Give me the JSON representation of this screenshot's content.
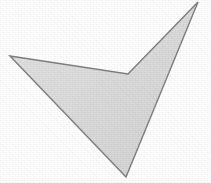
{
  "canvas": {
    "width": 211,
    "height": 183,
    "background_color": "#ffffff",
    "alt_text": "Scanned grayscale arrowhead / checkmark polygon"
  },
  "shape": {
    "name": "arrowhead-checkmark-polygon",
    "type": "polygon",
    "fill_color": "#dcdcdc",
    "stroke_color": "#7f7f7f",
    "stroke_width": 1.4,
    "texture": "scanned-paper-noise",
    "points_attr": "10,56 128,74 198,2 126,177",
    "vertices": [
      {
        "label": "left-tip",
        "x": 10,
        "y": 56
      },
      {
        "label": "inner-notch",
        "x": 128,
        "y": 74
      },
      {
        "label": "top-right-tip",
        "x": 198,
        "y": 2
      },
      {
        "label": "bottom-tip",
        "x": 126,
        "y": 177
      }
    ]
  }
}
